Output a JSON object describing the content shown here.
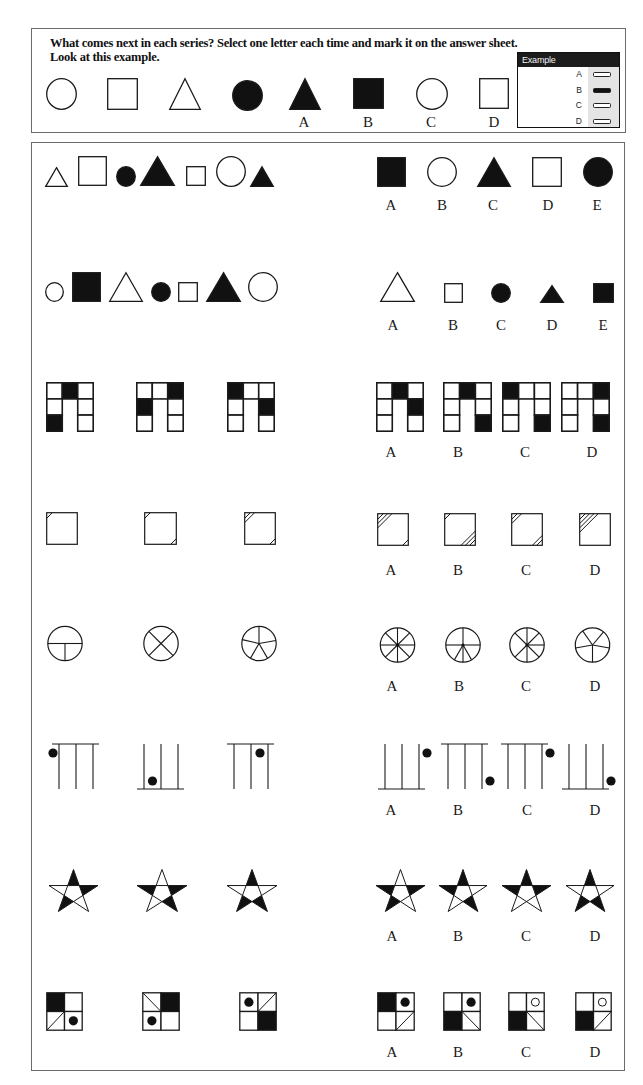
{
  "instructions": {
    "line1": "What comes next in each series? Select one letter each time and mark it on the answer sheet.",
    "line2": "Look at this example."
  },
  "example": {
    "sequence": [
      {
        "shape": "circle",
        "fill": "white"
      },
      {
        "shape": "square",
        "fill": "white"
      },
      {
        "shape": "triangle",
        "fill": "white"
      },
      {
        "shape": "circle",
        "fill": "black"
      }
    ],
    "options": [
      {
        "label": "A",
        "figure": {
          "shape": "triangle",
          "fill": "black"
        }
      },
      {
        "label": "B",
        "figure": {
          "shape": "square",
          "fill": "black"
        }
      },
      {
        "label": "C",
        "figure": {
          "shape": "circle",
          "fill": "white"
        }
      },
      {
        "label": "D",
        "figure": {
          "shape": "square",
          "fill": "white"
        }
      }
    ],
    "answer_card": {
      "title": "Example",
      "rows": [
        {
          "label": "A",
          "marked": false
        },
        {
          "label": "B",
          "marked": true
        },
        {
          "label": "C",
          "marked": false
        },
        {
          "label": "D",
          "marked": false
        }
      ]
    }
  },
  "questions": [
    {
      "number": 1,
      "sequence": [
        {
          "shape": "triangle",
          "fill": "white",
          "size": "small"
        },
        {
          "shape": "square",
          "fill": "white",
          "size": "large"
        },
        {
          "shape": "circle",
          "fill": "black",
          "size": "small"
        },
        {
          "shape": "triangle",
          "fill": "black",
          "size": "large"
        },
        {
          "shape": "square",
          "fill": "white",
          "size": "small"
        },
        {
          "shape": "circle",
          "fill": "white",
          "size": "large"
        },
        {
          "shape": "triangle",
          "fill": "black",
          "size": "small"
        }
      ],
      "options": [
        {
          "label": "A",
          "figure": {
            "shape": "square",
            "fill": "black",
            "size": "large"
          }
        },
        {
          "label": "B",
          "figure": {
            "shape": "circle",
            "fill": "white",
            "size": "large"
          }
        },
        {
          "label": "C",
          "figure": {
            "shape": "triangle",
            "fill": "black",
            "size": "large"
          }
        },
        {
          "label": "D",
          "figure": {
            "shape": "square",
            "fill": "white",
            "size": "large"
          }
        },
        {
          "label": "E",
          "figure": {
            "shape": "circle",
            "fill": "black",
            "size": "large"
          }
        }
      ]
    },
    {
      "number": 2,
      "sequence": [
        {
          "shape": "circle",
          "fill": "white",
          "size": "small"
        },
        {
          "shape": "square",
          "fill": "black",
          "size": "large"
        },
        {
          "shape": "triangle",
          "fill": "white",
          "size": "large"
        },
        {
          "shape": "circle",
          "fill": "black",
          "size": "small"
        },
        {
          "shape": "square",
          "fill": "white",
          "size": "small"
        },
        {
          "shape": "triangle",
          "fill": "black",
          "size": "large"
        },
        {
          "shape": "circle",
          "fill": "white",
          "size": "large"
        }
      ],
      "options": [
        {
          "label": "A",
          "figure": {
            "shape": "triangle",
            "fill": "white",
            "size": "large"
          }
        },
        {
          "label": "B",
          "figure": {
            "shape": "square",
            "fill": "white",
            "size": "small"
          }
        },
        {
          "label": "C",
          "figure": {
            "shape": "circle",
            "fill": "black",
            "size": "small"
          }
        },
        {
          "label": "D",
          "figure": {
            "shape": "triangle",
            "fill": "black",
            "size": "small"
          }
        },
        {
          "label": "E",
          "figure": {
            "shape": "square",
            "fill": "black",
            "size": "small"
          }
        }
      ]
    },
    {
      "number": 3,
      "sequence": [
        {
          "shape": "arch",
          "top": [
            "white",
            "black",
            "white"
          ],
          "left": [
            "white",
            "black"
          ],
          "right": [
            "white",
            "white"
          ]
        },
        {
          "shape": "arch",
          "top": [
            "white",
            "white",
            "black"
          ],
          "left": [
            "black",
            "white"
          ],
          "right": [
            "white",
            "white"
          ]
        },
        {
          "shape": "arch",
          "top": [
            "black",
            "white",
            "white"
          ],
          "left": [
            "white",
            "white"
          ],
          "right": [
            "black",
            "white"
          ]
        }
      ],
      "options": [
        {
          "label": "A",
          "figure": {
            "shape": "arch",
            "top": [
              "white",
              "black",
              "white"
            ],
            "left": [
              "white",
              "white"
            ],
            "right": [
              "black",
              "white"
            ]
          }
        },
        {
          "label": "B",
          "figure": {
            "shape": "arch",
            "top": [
              "white",
              "black",
              "white"
            ],
            "left": [
              "white",
              "white"
            ],
            "right": [
              "white",
              "black"
            ]
          }
        },
        {
          "label": "C",
          "figure": {
            "shape": "arch",
            "top": [
              "black",
              "white",
              "white"
            ],
            "left": [
              "white",
              "white"
            ],
            "right": [
              "white",
              "black"
            ]
          }
        },
        {
          "label": "D",
          "figure": {
            "shape": "arch",
            "top": [
              "white",
              "white",
              "black"
            ],
            "left": [
              "white",
              "white"
            ],
            "right": [
              "white",
              "black"
            ]
          }
        }
      ]
    },
    {
      "number": 4,
      "sequence": [
        {
          "shape": "hatch",
          "tl": 1,
          "br": 0
        },
        {
          "shape": "hatch",
          "tl": 1,
          "br": 1
        },
        {
          "shape": "hatch",
          "tl": 2,
          "br": 1
        }
      ],
      "options": [
        {
          "label": "A",
          "figure": {
            "shape": "hatch",
            "tl": 3,
            "br": 1
          }
        },
        {
          "label": "B",
          "figure": {
            "shape": "hatch",
            "tl": 1,
            "br": 3
          }
        },
        {
          "label": "C",
          "figure": {
            "shape": "hatch",
            "tl": 2,
            "br": 2
          }
        },
        {
          "label": "D",
          "figure": {
            "shape": "hatch",
            "tl": 4,
            "br": 0
          }
        }
      ]
    },
    {
      "number": 5,
      "sequence": [
        {
          "shape": "spokes",
          "spokes": [
            90,
            270,
            180
          ],
          "hub": false
        },
        {
          "shape": "spokes",
          "spokes": [
            45,
            135,
            225,
            315
          ],
          "hub": false
        },
        {
          "shape": "spokes",
          "spokes": [
            0,
            80,
            150,
            210,
            283
          ],
          "hub": false
        }
      ],
      "options": [
        {
          "label": "A",
          "figure": {
            "shape": "spokes",
            "spokes": [
              0,
              45,
              90,
              135,
              180,
              225,
              270,
              315
            ],
            "hub": true
          }
        },
        {
          "label": "B",
          "figure": {
            "shape": "spokes",
            "spokes": [
              0,
              90,
              150,
              180,
              210,
              270
            ],
            "hub": true
          }
        },
        {
          "label": "C",
          "figure": {
            "shape": "spokes",
            "spokes": [
              0,
              45,
              90,
              135,
              180,
              225,
              315
            ],
            "hub": true
          }
        },
        {
          "label": "D",
          "figure": {
            "shape": "spokes",
            "spokes": [
              325,
              40,
              100,
              180,
              260
            ],
            "hub": false
          }
        }
      ]
    },
    {
      "number": 6,
      "sequence": [
        {
          "shape": "comb",
          "bar": "top",
          "dot_slot": 0,
          "dot_pos": "top"
        },
        {
          "shape": "comb",
          "bar": "bottom",
          "dot_slot": 1,
          "dot_pos": "bottom"
        },
        {
          "shape": "comb",
          "bar": "top",
          "dot_slot": 2,
          "dot_pos": "top"
        }
      ],
      "options": [
        {
          "label": "A",
          "figure": {
            "shape": "comb",
            "bar": "bottom",
            "dot_slot": 3,
            "dot_pos": "top"
          }
        },
        {
          "label": "B",
          "figure": {
            "shape": "comb",
            "bar": "top",
            "dot_slot": 3,
            "dot_pos": "bottom"
          }
        },
        {
          "label": "C",
          "figure": {
            "shape": "comb",
            "bar": "top",
            "dot_slot": 3,
            "dot_pos": "top"
          }
        },
        {
          "label": "D",
          "figure": {
            "shape": "comb",
            "bar": "bottom",
            "dot_slot": 3,
            "dot_pos": "bottom"
          }
        }
      ]
    },
    {
      "number": 7,
      "sequence": [
        {
          "shape": "star",
          "black_tips": [
            "top",
            "upper-right",
            "lower-left"
          ]
        },
        {
          "shape": "star",
          "black_tips": [
            "upper-left",
            "upper-right",
            "lower-right"
          ]
        },
        {
          "shape": "star",
          "black_tips": [
            "top",
            "lower-left",
            "lower-right"
          ]
        }
      ],
      "options": [
        {
          "label": "A",
          "figure": {
            "shape": "star",
            "black_tips": [
              "upper-left",
              "upper-right",
              "lower-left"
            ]
          }
        },
        {
          "label": "B",
          "figure": {
            "shape": "star",
            "black_tips": [
              "top",
              "upper-left",
              "lower-right"
            ]
          }
        },
        {
          "label": "C",
          "figure": {
            "shape": "star",
            "black_tips": [
              "top",
              "upper-left",
              "upper-right"
            ]
          }
        },
        {
          "label": "D",
          "figure": {
            "shape": "star",
            "black_tips": [
              "top",
              "lower-left",
              "lower-right"
            ]
          }
        }
      ]
    },
    {
      "number": 8,
      "sequence": [
        {
          "shape": "quad",
          "tl": "black",
          "tr": "empty",
          "bl": "diag-up",
          "br": "dot"
        },
        {
          "shape": "quad",
          "tl": "diag-down",
          "tr": "black",
          "bl": "dot",
          "br": "empty"
        },
        {
          "shape": "quad",
          "tl": "dot",
          "tr": "diag-up",
          "bl": "empty",
          "br": "black"
        }
      ],
      "options": [
        {
          "label": "A",
          "figure": {
            "shape": "quad",
            "tl": "black",
            "tr": "dot",
            "bl": "empty",
            "br": "diag-up"
          }
        },
        {
          "label": "B",
          "figure": {
            "shape": "quad",
            "tl": "empty",
            "tr": "dot",
            "bl": "black",
            "br": "diag-down"
          }
        },
        {
          "label": "C",
          "figure": {
            "shape": "quad",
            "tl": "empty",
            "tr": "ring",
            "bl": "black",
            "br": "diag-down"
          }
        },
        {
          "label": "D",
          "figure": {
            "shape": "quad",
            "tl": "empty",
            "tr": "ring",
            "bl": "black",
            "br": "diag-up"
          }
        }
      ]
    }
  ]
}
